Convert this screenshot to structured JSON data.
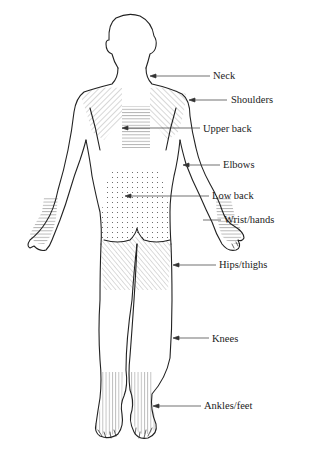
{
  "figure": {
    "colors": {
      "ink": "#222222",
      "hatch": "#999999",
      "background": "#ffffff"
    },
    "labels": [
      {
        "id": "neck",
        "text": "Neck",
        "x": 213,
        "y": 70,
        "arrow_from": 210,
        "arrow_to": 150,
        "arrow_y": 76
      },
      {
        "id": "shoulders",
        "text": "Shoulders",
        "x": 231,
        "y": 94,
        "arrow_from": 227,
        "arrow_to": 170,
        "arrow_y": 100
      },
      {
        "id": "upper-back",
        "text": "Upper back",
        "x": 203,
        "y": 123,
        "arrow_from": 200,
        "arrow_to": 122,
        "arrow_y": 128
      },
      {
        "id": "elbows",
        "text": "Elbows",
        "x": 223,
        "y": 159,
        "arrow_from": 220,
        "arrow_to": 183,
        "arrow_y": 165
      },
      {
        "id": "low-back",
        "text": "Low back",
        "x": 212,
        "y": 190,
        "arrow_from": 209,
        "arrow_to": 125,
        "arrow_y": 196
      },
      {
        "id": "wrist-hands",
        "text": "Wrist/hands",
        "x": 224,
        "y": 214,
        "arrow_from": 221,
        "arrow_to": 200,
        "arrow_y": 220
      },
      {
        "id": "hips-thighs",
        "text": "Hips/thighs",
        "x": 219,
        "y": 259,
        "arrow_from": 216,
        "arrow_to": 160,
        "arrow_y": 265
      },
      {
        "id": "knees",
        "text": "Knees",
        "x": 212,
        "y": 333,
        "arrow_from": 209,
        "arrow_to": 157,
        "arrow_y": 338
      },
      {
        "id": "ankles-feet",
        "text": "Ankles/feet",
        "x": 204,
        "y": 400,
        "arrow_from": 201,
        "arrow_to": 149,
        "arrow_y": 406
      }
    ]
  }
}
